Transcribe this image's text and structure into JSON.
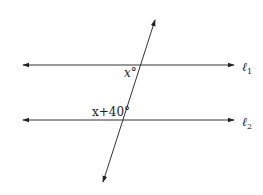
{
  "diagram": {
    "type": "parallel-lines-transversal",
    "lines": [
      {
        "id": "l1",
        "label": "ℓ",
        "subscript": "1",
        "y": 65
      },
      {
        "id": "l2",
        "label": "ℓ",
        "subscript": "2",
        "y": 120
      }
    ],
    "angles": [
      {
        "id": "angle-top",
        "label": "x°",
        "at_line": "l1"
      },
      {
        "id": "angle-bottom",
        "label": "x+40°",
        "at_line": "l2"
      }
    ],
    "colors": {
      "stroke": "#222222",
      "background": "#ffffff"
    }
  }
}
